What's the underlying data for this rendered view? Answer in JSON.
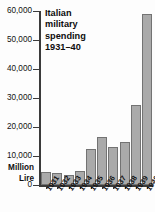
{
  "chart_data": {
    "type": "bar",
    "title_lines": [
      "Italian",
      "military",
      "spending",
      "1931–40"
    ],
    "xlabel": "",
    "ylabel": "Million Lire",
    "ylabel_lines": [
      "Million",
      "Lire"
    ],
    "categories": [
      "1931",
      "1932",
      "1933",
      "1934",
      "1935",
      "1936",
      "1937",
      "1938",
      "1939",
      "1940"
    ],
    "values": [
      4400,
      4200,
      3600,
      5000,
      12400,
      16400,
      13000,
      15000,
      27700,
      58800
    ],
    "ylim": [
      0,
      60000
    ],
    "ytick_values": [
      0,
      10000,
      20000,
      30000,
      40000,
      50000,
      60000
    ],
    "ytick_labels": [
      "0",
      "10,000",
      "20,000",
      "30,000",
      "40,000",
      "50,000",
      "60,000"
    ],
    "grid": false,
    "legend": null,
    "series": [
      {
        "name": "Italian military spending",
        "values": [
          4400,
          4200,
          3600,
          5000,
          12400,
          16400,
          13000,
          15000,
          27700,
          58800
        ]
      }
    ],
    "colors": {
      "bar_fill": "#aaaaaa",
      "bar_border": "#737373",
      "axis": "#3b3b3b",
      "text": "#111111",
      "background": "#fdfdfd"
    }
  }
}
